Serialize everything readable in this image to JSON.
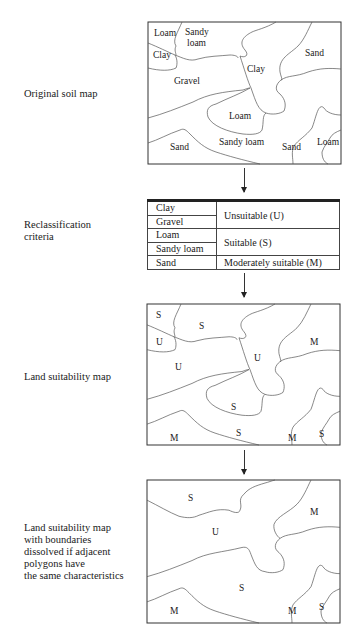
{
  "labels": {
    "original": "Original soil map",
    "criteria": "Reclassification\ncriteria",
    "suitability": "Land suitability map",
    "dissolved": "Land suitability map\nwith boundaries\ndissolved if adjacent\npolygons have\nthe same characteristics"
  },
  "original_map": {
    "regions": [
      {
        "name": "loam-top-left",
        "label": "Loam"
      },
      {
        "name": "sandy-loam-top",
        "label": "Sandy\nloam"
      },
      {
        "name": "clay-left",
        "label": "Clay"
      },
      {
        "name": "gravel",
        "label": "Gravel"
      },
      {
        "name": "clay-center",
        "label": "Clay"
      },
      {
        "name": "sand-top-right",
        "label": "Sand"
      },
      {
        "name": "loam-center",
        "label": "Loam"
      },
      {
        "name": "sand-bottom-left",
        "label": "Sand"
      },
      {
        "name": "sandy-loam-bottom",
        "label": "Sandy loam"
      },
      {
        "name": "sand-bottom-right",
        "label": "Sand"
      },
      {
        "name": "loam-bottom-right",
        "label": "Loam"
      }
    ]
  },
  "criteria_table": {
    "rows": [
      {
        "soil": "Clay",
        "class": "Unsuitable (U)",
        "span": 2
      },
      {
        "soil": "Gravel"
      },
      {
        "soil": "Loam",
        "class": "Suitable (S)",
        "span": 2
      },
      {
        "soil": "Sandy loam"
      },
      {
        "soil": "Sand",
        "class": "Moderately suitable (M)",
        "span": 1
      }
    ]
  },
  "suitability_map": {
    "regions": [
      {
        "name": "loam-top-left",
        "label": "S"
      },
      {
        "name": "sandy-loam-top",
        "label": "S"
      },
      {
        "name": "clay-left",
        "label": "U"
      },
      {
        "name": "gravel",
        "label": "U"
      },
      {
        "name": "clay-center",
        "label": "U"
      },
      {
        "name": "sand-top-right",
        "label": "M"
      },
      {
        "name": "loam-center",
        "label": "S"
      },
      {
        "name": "sand-bottom-left",
        "label": "M"
      },
      {
        "name": "sandy-loam-bottom",
        "label": "S"
      },
      {
        "name": "sand-bottom-right",
        "label": "M"
      },
      {
        "name": "loam-bottom-right",
        "label": "S"
      }
    ]
  },
  "dissolved_map": {
    "regions": [
      {
        "name": "s-top",
        "label": "S"
      },
      {
        "name": "u-merged",
        "label": "U"
      },
      {
        "name": "m-top-right",
        "label": "M"
      },
      {
        "name": "s-merged",
        "label": "S"
      },
      {
        "name": "m-bottom-left",
        "label": "M"
      },
      {
        "name": "m-bottom-right",
        "label": "M"
      },
      {
        "name": "s-bottom-right",
        "label": "S"
      }
    ]
  }
}
